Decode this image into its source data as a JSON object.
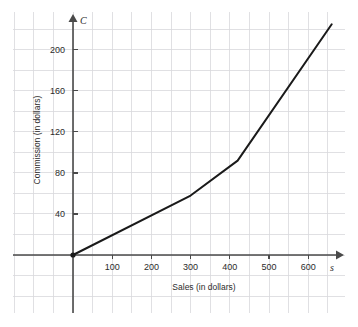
{
  "chart_data": {
    "type": "line",
    "title": "",
    "xlabel": "Sales (in dollars)",
    "ylabel": "Commission (in dollars)",
    "x_axis_variable": "s",
    "y_axis_variable": "C",
    "xlim": [
      -50,
      700
    ],
    "ylim": [
      -40,
      240
    ],
    "xticks": [
      100,
      200,
      300,
      400,
      500,
      600
    ],
    "yticks": [
      40,
      80,
      120,
      160,
      200
    ],
    "xtick_labels": [
      "100",
      "200",
      "300",
      "400",
      "500",
      "600"
    ],
    "ytick_labels": [
      "40",
      "80",
      "120",
      "160",
      "200"
    ],
    "grid": true,
    "grid_spacing_x": 50,
    "grid_spacing_y": 20,
    "legend": "none",
    "series": [
      {
        "name": "Commission",
        "x": [
          0,
          300,
          420,
          660
        ],
        "y": [
          0,
          58,
          92,
          225
        ]
      }
    ],
    "markers": [
      {
        "label": "origin",
        "x": 0,
        "y": 0
      }
    ],
    "colors": {
      "line": "#1a1a1a",
      "axis": "#4a4a4a",
      "grid": "#d8d8dc",
      "text": "#2b2b2b",
      "background": "#ffffff"
    }
  }
}
